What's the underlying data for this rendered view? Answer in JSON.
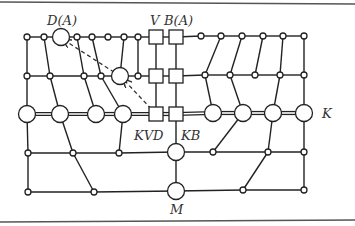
{
  "figure": {
    "type": "network-graph",
    "labels": {
      "top_left_node": "D(A)",
      "vertical_square_1": "V",
      "vertical_square_2": "B(A)",
      "lower_square_1": "KVD",
      "lower_square_2": "KB",
      "main_row": "K",
      "bottom_node": "M"
    },
    "colors": {
      "line": "#222222",
      "background": "#ffffff",
      "rule": "#555555"
    },
    "rows_y": [
      37,
      75,
      113,
      152,
      190
    ],
    "columns_x": {
      "left": 27,
      "square_v": 156,
      "square_b": 176,
      "right": 304
    },
    "nodes": {
      "row1": [
        {
          "x": 27,
          "y": 37,
          "kind": "small"
        },
        {
          "x": 44,
          "y": 37,
          "kind": "small"
        },
        {
          "x": 61,
          "y": 37,
          "kind": "large",
          "label": "D(A)"
        },
        {
          "x": 77,
          "y": 37,
          "kind": "small"
        },
        {
          "x": 92,
          "y": 37,
          "kind": "small"
        },
        {
          "x": 108,
          "y": 37,
          "kind": "small"
        },
        {
          "x": 124,
          "y": 37,
          "kind": "small"
        },
        {
          "x": 138,
          "y": 37,
          "kind": "small"
        },
        {
          "x": 156,
          "y": 37,
          "kind": "square",
          "label": "V"
        },
        {
          "x": 176,
          "y": 37,
          "kind": "square",
          "label": "B(A)"
        },
        {
          "x": 201,
          "y": 36,
          "kind": "small"
        },
        {
          "x": 221,
          "y": 36,
          "kind": "small"
        },
        {
          "x": 242,
          "y": 36,
          "kind": "small"
        },
        {
          "x": 263,
          "y": 36,
          "kind": "small"
        },
        {
          "x": 283,
          "y": 36,
          "kind": "small"
        },
        {
          "x": 304,
          "y": 36,
          "kind": "small"
        }
      ],
      "row2": [
        {
          "x": 27,
          "y": 76,
          "kind": "small"
        },
        {
          "x": 50,
          "y": 76,
          "kind": "small"
        },
        {
          "x": 84,
          "y": 76,
          "kind": "small"
        },
        {
          "x": 101,
          "y": 76,
          "kind": "small"
        },
        {
          "x": 120,
          "y": 76,
          "kind": "large"
        },
        {
          "x": 138,
          "y": 76,
          "kind": "small"
        },
        {
          "x": 156,
          "y": 76,
          "kind": "square"
        },
        {
          "x": 176,
          "y": 76,
          "kind": "square"
        },
        {
          "x": 205,
          "y": 75,
          "kind": "small"
        },
        {
          "x": 230,
          "y": 75,
          "kind": "small"
        },
        {
          "x": 255,
          "y": 75,
          "kind": "small"
        },
        {
          "x": 280,
          "y": 75,
          "kind": "small"
        },
        {
          "x": 304,
          "y": 75,
          "kind": "small"
        }
      ],
      "row3": [
        {
          "x": 27,
          "y": 114,
          "kind": "large"
        },
        {
          "x": 60,
          "y": 114,
          "kind": "large"
        },
        {
          "x": 96,
          "y": 114,
          "kind": "large"
        },
        {
          "x": 123,
          "y": 114,
          "kind": "large"
        },
        {
          "x": 156,
          "y": 114,
          "kind": "square",
          "label": "KVD"
        },
        {
          "x": 176,
          "y": 114,
          "kind": "square",
          "label": "KB"
        },
        {
          "x": 213,
          "y": 113,
          "kind": "large"
        },
        {
          "x": 243,
          "y": 113,
          "kind": "large"
        },
        {
          "x": 273,
          "y": 113,
          "kind": "large"
        },
        {
          "x": 304,
          "y": 113,
          "kind": "large",
          "label": "K"
        }
      ],
      "row4": [
        {
          "x": 28,
          "y": 153,
          "kind": "small"
        },
        {
          "x": 73,
          "y": 153,
          "kind": "small"
        },
        {
          "x": 119,
          "y": 153,
          "kind": "small"
        },
        {
          "x": 176,
          "y": 152,
          "kind": "large"
        },
        {
          "x": 213,
          "y": 152,
          "kind": "small"
        },
        {
          "x": 268,
          "y": 152,
          "kind": "small"
        },
        {
          "x": 304,
          "y": 152,
          "kind": "small"
        }
      ],
      "row5": [
        {
          "x": 28,
          "y": 192,
          "kind": "small"
        },
        {
          "x": 94,
          "y": 192,
          "kind": "small"
        },
        {
          "x": 176,
          "y": 191,
          "kind": "large",
          "label": "M"
        },
        {
          "x": 243,
          "y": 190,
          "kind": "small"
        },
        {
          "x": 304,
          "y": 190,
          "kind": "small"
        }
      ]
    },
    "dashed_arrows": [
      {
        "from": [
          120,
          76
        ],
        "to": [
          64,
          40
        ]
      },
      {
        "from": [
          156,
          114
        ],
        "to": [
          124,
          80
        ]
      }
    ]
  }
}
